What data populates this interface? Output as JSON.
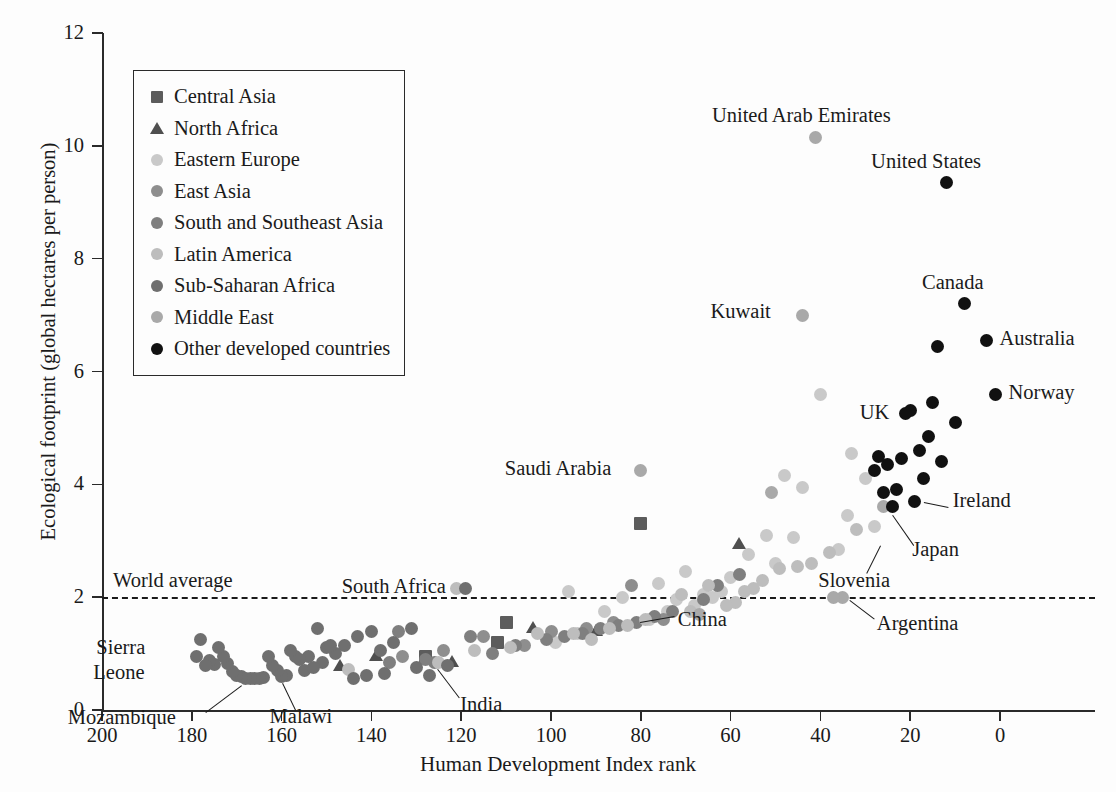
{
  "chart_data": {
    "type": "scatter",
    "title": "",
    "xlabel": "Human Development Index rank",
    "ylabel": "Ecological footprint (global hectares per person)",
    "xlim": [
      200,
      0
    ],
    "ylim": [
      0,
      12
    ],
    "x_ticks": [
      200,
      180,
      160,
      140,
      120,
      100,
      80,
      60,
      40,
      20,
      0
    ],
    "y_ticks": [
      0,
      2,
      4,
      6,
      8,
      10,
      12
    ],
    "x_axis_reversed": true,
    "grid": false,
    "legend_position": "top-left inside",
    "reference_line": {
      "label": "World average",
      "y": 2.0,
      "style": "dashed"
    },
    "series": [
      {
        "name": "Central Asia",
        "marker": "square",
        "color": "#5c5c5c",
        "points": [
          [
            80,
            3.3
          ],
          [
            110,
            1.55
          ],
          [
            112,
            1.2
          ],
          [
            128,
            0.95
          ]
        ]
      },
      {
        "name": "North Africa",
        "marker": "triangle",
        "color": "#4f4f4f",
        "points": [
          [
            58,
            2.95
          ],
          [
            90,
            1.4
          ],
          [
            104,
            1.45
          ],
          [
            122,
            0.85
          ],
          [
            139,
            0.95
          ],
          [
            147,
            0.78
          ]
        ]
      },
      {
        "name": "Eastern Europe",
        "marker": "circle",
        "color": "#c9c9c9",
        "points": [
          [
            28,
            3.25
          ],
          [
            30,
            4.1
          ],
          [
            33,
            4.55
          ],
          [
            34,
            3.45
          ],
          [
            36,
            2.85
          ],
          [
            40,
            5.6
          ],
          [
            44,
            3.95
          ],
          [
            46,
            3.05
          ],
          [
            48,
            4.15
          ],
          [
            50,
            2.6
          ],
          [
            52,
            3.1
          ],
          [
            56,
            2.75
          ],
          [
            60,
            2.35
          ],
          [
            62,
            2.1
          ],
          [
            64,
            2.0
          ],
          [
            66,
            2.05
          ],
          [
            68,
            1.85
          ],
          [
            70,
            2.45
          ],
          [
            72,
            1.95
          ],
          [
            74,
            1.75
          ],
          [
            76,
            2.25
          ],
          [
            78,
            1.6
          ],
          [
            84,
            2.0
          ],
          [
            88,
            1.75
          ],
          [
            94,
            1.35
          ],
          [
            96,
            2.1
          ],
          [
            99,
            1.2
          ]
        ]
      },
      {
        "name": "East Asia",
        "marker": "circle",
        "color": "#8e8e8e",
        "points": [
          [
            75,
            1.6
          ],
          [
            82,
            2.2
          ],
          [
            86,
            1.55
          ],
          [
            92,
            1.45
          ],
          [
            100,
            1.4
          ],
          [
            106,
            1.15
          ],
          [
            115,
            1.3
          ],
          [
            124,
            1.05
          ],
          [
            133,
            0.95
          ]
        ]
      },
      {
        "name": "South and Southeast Asia",
        "marker": "circle",
        "color": "#7f7f7f",
        "points": [
          [
            58,
            2.4
          ],
          [
            63,
            2.2
          ],
          [
            66,
            1.95
          ],
          [
            73,
            1.75
          ],
          [
            77,
            1.65
          ],
          [
            81,
            1.55
          ],
          [
            85,
            1.5
          ],
          [
            89,
            1.45
          ],
          [
            93,
            1.35
          ],
          [
            97,
            1.3
          ],
          [
            101,
            1.25
          ],
          [
            108,
            1.15
          ],
          [
            113,
            1.0
          ],
          [
            118,
            1.3
          ],
          [
            126,
            0.85
          ],
          [
            128,
            0.9
          ],
          [
            134,
            1.4
          ],
          [
            136,
            0.85
          ]
        ]
      },
      {
        "name": "Latin America",
        "marker": "circle",
        "color": "#bdbdbd",
        "points": [
          [
            32,
            3.2
          ],
          [
            38,
            2.8
          ],
          [
            42,
            2.6
          ],
          [
            45,
            2.55
          ],
          [
            49,
            2.5
          ],
          [
            53,
            2.3
          ],
          [
            55,
            2.15
          ],
          [
            57,
            2.1
          ],
          [
            59,
            1.9
          ],
          [
            61,
            1.85
          ],
          [
            65,
            2.2
          ],
          [
            69,
            1.75
          ],
          [
            71,
            2.05
          ],
          [
            79,
            1.6
          ],
          [
            83,
            1.5
          ],
          [
            87,
            1.45
          ],
          [
            91,
            1.25
          ],
          [
            95,
            1.35
          ],
          [
            103,
            1.35
          ],
          [
            109,
            1.1
          ],
          [
            117,
            1.05
          ],
          [
            121,
            2.15
          ],
          [
            125,
            0.85
          ],
          [
            145,
            0.72
          ]
        ]
      },
      {
        "name": "Sub-Saharan Africa",
        "marker": "circle",
        "color": "#6f6f6f",
        "points": [
          [
            119,
            2.15
          ],
          [
            131,
            1.45
          ],
          [
            140,
            1.4
          ],
          [
            143,
            1.3
          ],
          [
            146,
            1.15
          ],
          [
            148,
            1.0
          ],
          [
            150,
            1.1
          ],
          [
            152,
            1.45
          ],
          [
            154,
            0.95
          ],
          [
            155,
            0.7
          ],
          [
            156,
            0.9
          ],
          [
            157,
            0.95
          ],
          [
            158,
            1.05
          ],
          [
            159,
            0.62
          ],
          [
            160,
            0.6
          ],
          [
            161,
            0.7
          ],
          [
            162,
            0.78
          ],
          [
            163,
            0.95
          ],
          [
            164,
            0.58
          ],
          [
            165,
            0.55
          ],
          [
            166,
            0.55
          ],
          [
            167,
            0.56
          ],
          [
            168,
            0.55
          ],
          [
            169,
            0.6
          ],
          [
            170,
            0.62
          ],
          [
            171,
            0.68
          ],
          [
            172,
            0.82
          ],
          [
            173,
            0.95
          ],
          [
            174,
            1.1
          ],
          [
            175,
            0.8
          ],
          [
            176,
            0.88
          ],
          [
            177,
            0.78
          ],
          [
            178,
            1.25
          ],
          [
            179,
            0.95
          ],
          [
            137,
            0.65
          ],
          [
            141,
            0.62
          ],
          [
            144,
            0.55
          ],
          [
            130,
            0.75
          ],
          [
            127,
            0.62
          ],
          [
            123,
            0.78
          ],
          [
            135,
            1.2
          ],
          [
            138,
            1.05
          ],
          [
            149,
            1.15
          ],
          [
            151,
            0.85
          ],
          [
            153,
            0.75
          ]
        ]
      },
      {
        "name": "Middle East",
        "marker": "circle",
        "color": "#a9a9a9",
        "points": [
          [
            41,
            10.15
          ],
          [
            44,
            7.0
          ],
          [
            80,
            4.25
          ],
          [
            51,
            3.85
          ],
          [
            26,
            3.6
          ],
          [
            35,
            2.0
          ],
          [
            37,
            2.0
          ],
          [
            67,
            1.7
          ]
        ]
      },
      {
        "name": "Other developed countries",
        "marker": "circle",
        "color": "#111111",
        "points": [
          [
            12,
            9.35
          ],
          [
            8,
            7.2
          ],
          [
            3,
            6.55
          ],
          [
            14,
            6.45
          ],
          [
            1,
            5.6
          ],
          [
            20,
            5.3
          ],
          [
            21,
            5.25
          ],
          [
            10,
            5.1
          ],
          [
            16,
            4.85
          ],
          [
            18,
            4.6
          ],
          [
            22,
            4.45
          ],
          [
            25,
            4.35
          ],
          [
            28,
            4.25
          ],
          [
            13,
            4.4
          ],
          [
            17,
            4.1
          ],
          [
            23,
            3.9
          ],
          [
            26,
            3.85
          ],
          [
            19,
            3.7
          ],
          [
            24,
            3.6
          ],
          [
            15,
            5.45
          ],
          [
            27,
            4.5
          ]
        ]
      }
    ],
    "annotations": [
      {
        "label": "United Arab Emirates",
        "x": 41,
        "y": 10.15,
        "anchor": "above"
      },
      {
        "label": "United States",
        "x": 12,
        "y": 9.35,
        "anchor": "above"
      },
      {
        "label": "Kuwait",
        "x": 44,
        "y": 7.0,
        "anchor": "above"
      },
      {
        "label": "Canada",
        "x": 8,
        "y": 7.2,
        "anchor": "above"
      },
      {
        "label": "Australia",
        "x": 3,
        "y": 6.55,
        "anchor": "right"
      },
      {
        "label": "Norway",
        "x": 1,
        "y": 5.6,
        "anchor": "right"
      },
      {
        "label": "UK",
        "x": 21,
        "y": 5.25,
        "anchor": "left"
      },
      {
        "label": "Ireland",
        "x": 19,
        "y": 3.7,
        "anchor": "right-leader"
      },
      {
        "label": "Japan",
        "x": 24,
        "y": 3.6,
        "anchor": "below-leader"
      },
      {
        "label": "Slovenia",
        "x": 26,
        "y": 3.05,
        "anchor": "below-leader"
      },
      {
        "label": "Saudi Arabia",
        "x": 80,
        "y": 4.25,
        "anchor": "left"
      },
      {
        "label": "South Africa",
        "x": 119,
        "y": 2.15,
        "anchor": "left"
      },
      {
        "label": "China",
        "x": 82,
        "y": 1.6,
        "anchor": "right-leader"
      },
      {
        "label": "Argentina",
        "x": 35,
        "y": 2.0,
        "anchor": "below-leader"
      },
      {
        "label": "Sierra Leone",
        "x": 179,
        "y": 1.05,
        "anchor": "left-two-line"
      },
      {
        "label": "Mozambique",
        "x": 168,
        "y": 0.55,
        "anchor": "below-leader"
      },
      {
        "label": "Malawi",
        "x": 160,
        "y": 0.6,
        "anchor": "below-leader"
      },
      {
        "label": "India",
        "x": 126,
        "y": 0.85,
        "anchor": "below-leader"
      }
    ]
  },
  "axes": {
    "y_label": "Ecological footprint (global hectares per person)",
    "x_label": "Human Development Index rank",
    "y_ticks": [
      "0",
      "2",
      "4",
      "6",
      "8",
      "10",
      "12"
    ],
    "x_ticks": [
      "200",
      "180",
      "160",
      "140",
      "120",
      "100",
      "80",
      "60",
      "40",
      "20",
      "0"
    ]
  },
  "reference": {
    "label": "World average"
  },
  "legend": {
    "items": [
      {
        "label": "Central Asia",
        "marker": "square",
        "color": "#5c5c5c"
      },
      {
        "label": "North Africa",
        "marker": "triangle",
        "color": "#4f4f4f"
      },
      {
        "label": "Eastern Europe",
        "marker": "circle",
        "color": "#c9c9c9"
      },
      {
        "label": "East Asia",
        "marker": "circle",
        "color": "#8e8e8e"
      },
      {
        "label": "South and Southeast Asia",
        "marker": "circle",
        "color": "#7f7f7f"
      },
      {
        "label": "Latin America",
        "marker": "circle",
        "color": "#bdbdbd"
      },
      {
        "label": "Sub-Saharan Africa",
        "marker": "circle",
        "color": "#6f6f6f"
      },
      {
        "label": "Middle East",
        "marker": "circle",
        "color": "#a9a9a9"
      },
      {
        "label": "Other developed countries",
        "marker": "circle",
        "color": "#111111"
      }
    ]
  },
  "annotation_labels": {
    "uae": "United Arab Emirates",
    "usa": "United States",
    "kuwait": "Kuwait",
    "canada": "Canada",
    "australia": "Australia",
    "norway": "Norway",
    "uk": "UK",
    "ireland": "Ireland",
    "japan": "Japan",
    "slovenia": "Slovenia",
    "saudi": "Saudi Arabia",
    "southafrica": "South Africa",
    "china": "China",
    "argentina": "Argentina",
    "sierra1": "Sierra",
    "sierra2": "Leone",
    "mozambique": "Mozambique",
    "malawi": "Malawi",
    "india": "India"
  }
}
